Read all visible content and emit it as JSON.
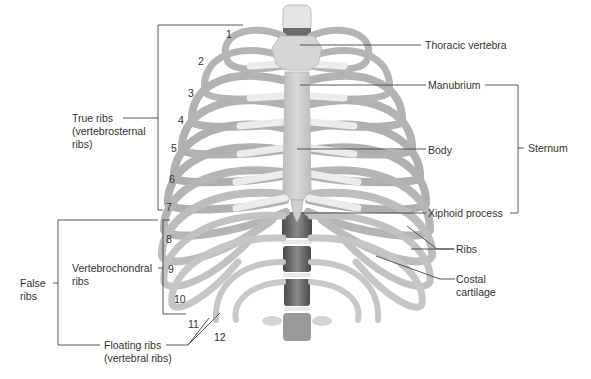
{
  "diagram": {
    "labels": {
      "thoracic_vertebra": "Thoracic vertebra",
      "manubrium": "Manubrium",
      "body": "Body",
      "sternum": "Sternum",
      "xiphoid_process": "Xiphoid process",
      "ribs": "Ribs",
      "costal_cartilage_line1": "Costal",
      "costal_cartilage_line2": "cartilage",
      "true_ribs_line1": "True ribs",
      "true_ribs_line2": "(vertebrosternal",
      "true_ribs_line3": "ribs)",
      "vertebrochondral_line1": "Vertebrochondral",
      "vertebrochondral_line2": "ribs",
      "false_ribs_line1": "False",
      "false_ribs_line2": "ribs",
      "floating_ribs_line1": "Floating ribs",
      "floating_ribs_line2": "(vertebral ribs)"
    },
    "rib_numbers": [
      "1",
      "2",
      "3",
      "4",
      "5",
      "6",
      "7",
      "8",
      "9",
      "10",
      "11",
      "12"
    ],
    "colors": {
      "bone": "#c9c9c9",
      "bone_shadow": "#8f8f8f",
      "cartilage": "#ececec",
      "vertebra_dark": "#5a5a5a",
      "leader_line": "#444444",
      "text": "#333333"
    }
  }
}
